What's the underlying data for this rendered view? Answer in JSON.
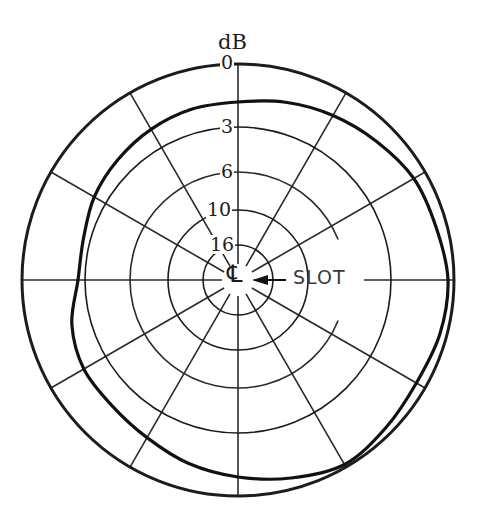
{
  "chart_data": {
    "type": "polar",
    "title": "",
    "unit_label": "dB",
    "angle_reference": "0° = top, clockwise",
    "radial_gridlines_deg": [
      0,
      30,
      60,
      90,
      120,
      150,
      180,
      210,
      240,
      270,
      300,
      330
    ],
    "rings": [
      {
        "label": "0",
        "db": 0,
        "radius_px": 216
      },
      {
        "label": "3",
        "db": 3,
        "radius_px": 153
      },
      {
        "label": "6",
        "db": 6,
        "radius_px": 108
      },
      {
        "label": "10",
        "db": 10,
        "radius_px": 70
      },
      {
        "label": "16",
        "db": 16,
        "radius_px": 35
      }
    ],
    "annotation": {
      "text": "SLOT",
      "arrow_to": "center",
      "symbol": "centerline"
    },
    "series": [
      {
        "name": "radiation pattern",
        "angles_deg": [
          0,
          15,
          30,
          45,
          60,
          75,
          90,
          105,
          120,
          135,
          150,
          165,
          180,
          195,
          210,
          225,
          240,
          255,
          270,
          285,
          300,
          315,
          330,
          345
        ],
        "radius_px": [
          178,
          184,
          190,
          196,
          203,
          205,
          210,
          209,
          206,
          209,
          213,
          205,
          197,
          190,
          182,
          178,
          178,
          172,
          160,
          160,
          166,
          170,
          174,
          177
        ],
        "approx_db": [
          1.6,
          1.3,
          1.0,
          0.8,
          0.5,
          0.4,
          0.2,
          0.3,
          0.4,
          0.3,
          0.1,
          0.4,
          0.8,
          1.1,
          1.4,
          1.6,
          1.6,
          1.9,
          2.6,
          2.6,
          2.2,
          2.0,
          1.8,
          1.7
        ]
      }
    ]
  },
  "labels": {
    "unit": "dB",
    "slot": "SLOT",
    "centerline": "℄"
  },
  "geometry": {
    "cx": 238,
    "cy": 280
  }
}
